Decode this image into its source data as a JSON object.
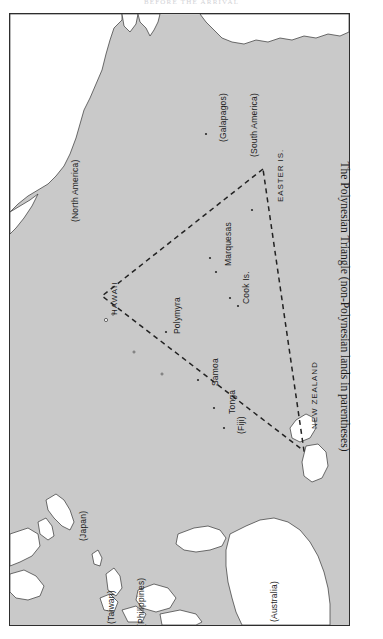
{
  "page": {
    "running_head": "BEFORE THE ARRIVAL"
  },
  "caption": {
    "text": "The Polynesian Triangle (non-Polynesian lands in parentheses)"
  },
  "map": {
    "ocean_color": "#c9c9c9",
    "land_color": "#ffffff",
    "border_color": "#2e2e2e",
    "triangle_style": "dashed",
    "labels": [
      {
        "id": "north-america",
        "text": "(North America)",
        "x": 60,
        "y": 208,
        "kind": "paren"
      },
      {
        "id": "galapagos",
        "text": "(Galapagos)",
        "x": 208,
        "y": 128,
        "kind": "paren"
      },
      {
        "id": "south-america",
        "text": "(South America)",
        "x": 239,
        "y": 143,
        "kind": "paren"
      },
      {
        "id": "easter-is",
        "text": "EASTER IS.",
        "x": 266,
        "y": 188,
        "kind": "caps"
      },
      {
        "id": "hawaii",
        "text": "HAWAII",
        "x": 100,
        "y": 301,
        "kind": "caps"
      },
      {
        "id": "polymyra",
        "text": "Polymyra",
        "x": 162,
        "y": 320,
        "kind": "plain"
      },
      {
        "id": "marquesas",
        "text": "Marquesas",
        "x": 213,
        "y": 252,
        "kind": "plain"
      },
      {
        "id": "cook-is",
        "text": "Cook Is.",
        "x": 231,
        "y": 290,
        "kind": "plain"
      },
      {
        "id": "samoa",
        "text": "Samoa",
        "x": 200,
        "y": 372,
        "kind": "plain"
      },
      {
        "id": "tonga",
        "text": "Tonga",
        "x": 217,
        "y": 400,
        "kind": "plain"
      },
      {
        "id": "fiji",
        "text": "(Fiji)",
        "x": 226,
        "y": 420,
        "kind": "paren"
      },
      {
        "id": "new-zealand",
        "text": "NEW ZEALAND",
        "x": 300,
        "y": 415,
        "kind": "caps"
      },
      {
        "id": "japan",
        "text": "(Japan)",
        "x": 68,
        "y": 527,
        "kind": "paren"
      },
      {
        "id": "taiwan",
        "text": "(Taiwan)",
        "x": 96,
        "y": 610,
        "kind": "paren"
      },
      {
        "id": "philippines",
        "text": "(Philippines)",
        "x": 126,
        "y": 613,
        "kind": "paren"
      },
      {
        "id": "australia",
        "text": "(Australia)",
        "x": 259,
        "y": 608,
        "kind": "paren"
      }
    ]
  }
}
